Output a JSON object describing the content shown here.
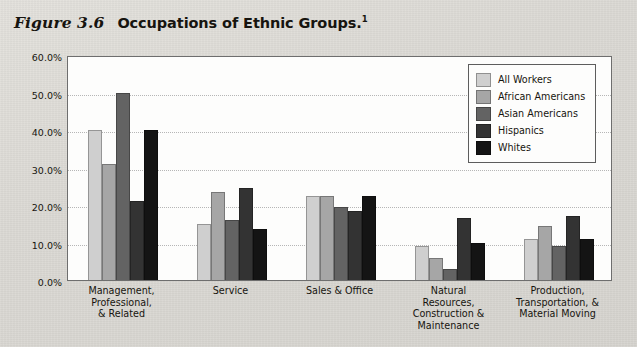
{
  "figure": {
    "label": "Figure 3.6",
    "title": "Occupations of Ethnic Groups.",
    "footnote_marker": "1"
  },
  "legend": {
    "position": "top-right",
    "entries": [
      {
        "name": "All Workers",
        "color": "#cfcfcf"
      },
      {
        "name": "African Americans",
        "color": "#a6a6a6"
      },
      {
        "name": "Asian Americans",
        "color": "#636363"
      },
      {
        "name": "Hispanics",
        "color": "#333333"
      },
      {
        "name": "Whites",
        "color": "#141414"
      }
    ]
  },
  "axis": {
    "yticks": [
      "0.0%",
      "10.0%",
      "20.0%",
      "30.0%",
      "40.0%",
      "50.0%",
      "60.0%"
    ],
    "ytick_values": [
      0,
      10,
      20,
      30,
      40,
      50,
      60
    ],
    "ylim": [
      0,
      60
    ],
    "grid": true
  },
  "categories_multiline": [
    [
      "Management,",
      "Professional,",
      "& Related"
    ],
    [
      "Service"
    ],
    [
      "Sales & Office"
    ],
    [
      "Natural",
      "Resources,",
      "Construction &",
      "Maintenance"
    ],
    [
      "Production,",
      "Transportation, &",
      "Material Moving"
    ]
  ],
  "chart_data": {
    "type": "bar",
    "title": "Occupations of Ethnic Groups.",
    "xlabel": "",
    "ylabel": "",
    "ylim": [
      0,
      60
    ],
    "ytick_labels": [
      "0.0%",
      "10.0%",
      "20.0%",
      "30.0%",
      "40.0%",
      "50.0%",
      "60.0%"
    ],
    "grid": true,
    "legend_position": "top-right",
    "categories": [
      "Management, Professional, & Related",
      "Service",
      "Sales & Office",
      "Natural Resources, Construction & Maintenance",
      "Production, Transportation, & Material Moving"
    ],
    "series": [
      {
        "name": "All Workers",
        "color": "#cfcfcf",
        "values": [
          40.0,
          15.0,
          22.3,
          9.0,
          11.0
        ]
      },
      {
        "name": "African Americans",
        "color": "#a6a6a6",
        "values": [
          31.0,
          23.5,
          22.3,
          6.0,
          14.5
        ]
      },
      {
        "name": "Asian Americans",
        "color": "#636363",
        "values": [
          50.0,
          16.0,
          19.5,
          3.0,
          9.0
        ]
      },
      {
        "name": "Hispanics",
        "color": "#333333",
        "values": [
          21.0,
          24.5,
          18.5,
          16.5,
          17.0
        ]
      },
      {
        "name": "Whites",
        "color": "#141414",
        "values": [
          40.0,
          13.5,
          22.3,
          10.0,
          11.0
        ]
      }
    ]
  },
  "colors": {
    "page_background": "#dcdad5",
    "plot_background": "#fdfdfc",
    "plot_border": "#6e6e6e",
    "gridline": "#b6b6b6",
    "text": "#17150f"
  }
}
